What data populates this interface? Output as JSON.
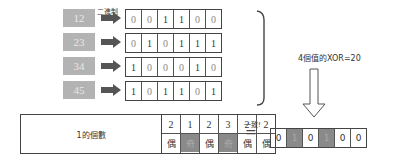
{
  "binary_label": "二進制",
  "rows": [
    {
      "decimal": "12",
      "bits": [
        "0",
        "0",
        "1",
        "1",
        "0",
        "0"
      ]
    },
    {
      "decimal": "23",
      "bits": [
        "0",
        "1",
        "0",
        "1",
        "1",
        "1"
      ]
    },
    {
      "decimal": "34",
      "bits": [
        "1",
        "0",
        "0",
        "0",
        "1",
        "0"
      ]
    },
    {
      "decimal": "45",
      "bits": [
        "1",
        "0",
        "1",
        "1",
        "0",
        "1"
      ]
    }
  ],
  "xor_label": "4個值的XOR=20",
  "count_table": {
    "label": "1的個數",
    "counts": [
      "2",
      "1",
      "2",
      "3",
      "2",
      "2"
    ],
    "parity": [
      "偶",
      "奇",
      "偶",
      "奇",
      "偶",
      "偶"
    ]
  },
  "match_label": "一致!",
  "equals_sign": "=",
  "result_bits": [
    "0",
    "1",
    "0",
    "1",
    "0",
    "0"
  ],
  "colors": {
    "shaded": "#8a8a8a",
    "number_box": "#b3b3b3",
    "arrow": "#555555"
  }
}
